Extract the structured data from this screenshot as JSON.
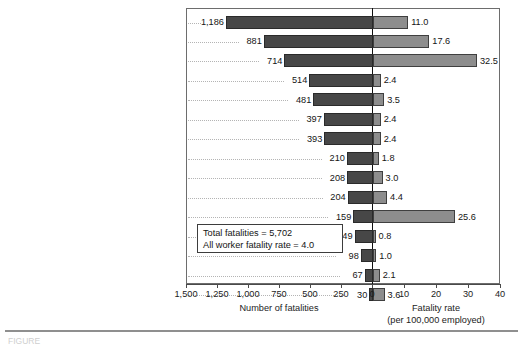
{
  "chart_data": {
    "type": "bar",
    "orientation": "horizontal",
    "layout": "diverging-dual-axis",
    "title": "",
    "categories": [
      "Construction",
      "Transportation and warehousing",
      "Agriculture, forestry, fishing, and hunting",
      "Government",
      "Professional and business services",
      "Retail trade",
      "Manufacturing",
      "Leisure and hospitality",
      "Other services (exc. public admin.)",
      "Wholesale trade",
      "Mining",
      "Educational and health services",
      "Financial activities",
      "Information",
      "Utilities"
    ],
    "series": [
      {
        "name": "Number of fatalities",
        "side": "left",
        "color": "#474747",
        "axis_label": "Number of fatalities",
        "ticks": [
          1500,
          1250,
          1000,
          750,
          500,
          250,
          0
        ],
        "tick_labels": [
          "1,500",
          "1,250",
          "1,000",
          "750",
          "500",
          "250",
          "0"
        ],
        "axis_max": 1500,
        "values": [
          1186,
          881,
          714,
          514,
          481,
          397,
          393,
          210,
          208,
          204,
          159,
          149,
          98,
          67,
          30
        ],
        "value_labels": [
          "1,186",
          "881",
          "714",
          "514",
          "481",
          "397",
          "393",
          "210",
          "208",
          "204",
          "159",
          "149",
          "98",
          "67",
          "30"
        ]
      },
      {
        "name": "Fatality rate (per 100,000 employed)",
        "side": "right",
        "color": "#8d8d8d",
        "axis_label_line1": "Fatality rate",
        "axis_label_line2": "(per 100,000 employed)",
        "ticks": [
          0,
          10,
          20,
          30,
          40
        ],
        "tick_labels": [
          "0",
          "10",
          "20",
          "30",
          "40"
        ],
        "axis_max": 40,
        "values": [
          11.0,
          17.6,
          32.5,
          2.4,
          3.5,
          2.4,
          2.4,
          1.8,
          3.0,
          4.4,
          25.6,
          0.8,
          1.0,
          2.1,
          3.6
        ],
        "value_labels": [
          "11.0",
          "17.6",
          "32.5",
          "2.4",
          "3.5",
          "2.4",
          "2.4",
          "1.8",
          "3.0",
          "4.4",
          "25.6",
          "0.8",
          "1.0",
          "2.1",
          "3.6"
        ]
      }
    ],
    "annotation": {
      "line1": "Total fatalities = 5,702",
      "line2": "All worker fatality rate = 4.0"
    },
    "grid": false,
    "leader_lines": true,
    "legend": "none"
  },
  "footer": {
    "caption": "FIGURE"
  }
}
